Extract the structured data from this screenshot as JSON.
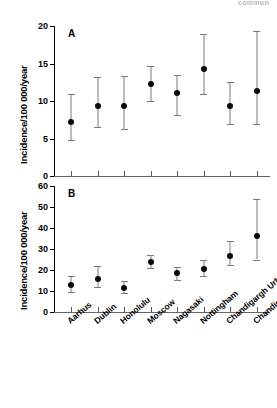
{
  "corner": {
    "text": "commun"
  },
  "chart_data": {
    "type": "scatter",
    "title": "",
    "categories": [
      "Aarhus",
      "Dublin",
      "Honolulu",
      "Moscow",
      "Nagasaki",
      "Nottingham",
      "Chandigargh Urban",
      "Chandigargh Rural"
    ],
    "panels": [
      {
        "letter": "A",
        "ylabel": "Incidence/100 000/year",
        "ylim": [
          0,
          20
        ],
        "yticks": [
          0,
          5,
          10,
          15,
          20
        ],
        "grid": false,
        "legend": "none",
        "values": [
          7.2,
          9.3,
          9.3,
          12.3,
          11.1,
          14.3,
          9.3,
          11.3
        ],
        "lower": [
          4.8,
          6.5,
          6.3,
          10.0,
          8.1,
          11.0,
          7.0,
          7.0
        ],
        "upper": [
          11.0,
          13.2,
          13.3,
          14.7,
          13.5,
          19.0,
          12.5,
          19.3
        ]
      },
      {
        "letter": "B",
        "ylabel": "Incidence/100 000/year",
        "ylim": [
          0,
          60
        ],
        "yticks": [
          0,
          10,
          20,
          30,
          40,
          50,
          60
        ],
        "grid": false,
        "legend": "none",
        "values": [
          13.0,
          15.9,
          11.4,
          23.7,
          18.4,
          20.4,
          26.5,
          36.2
        ],
        "lower": [
          9.7,
          11.9,
          9.0,
          21.0,
          15.4,
          17.0,
          22.2,
          25.0
        ],
        "upper": [
          17.0,
          22.0,
          15.0,
          27.0,
          21.6,
          25.0,
          34.0,
          54.0
        ]
      }
    ]
  }
}
